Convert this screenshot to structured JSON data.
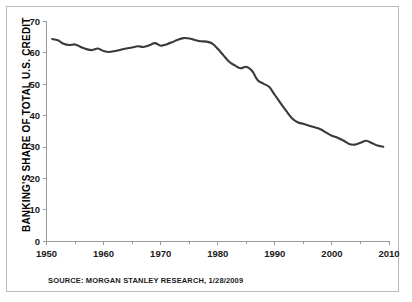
{
  "figure": {
    "source_note": "SOURCE: MORGAN STANLEY RESEARCH, 1/28/2009",
    "line_color": "#3a3a3a",
    "axis_color": "#9a9a9a",
    "border_color": "#b9b9b9",
    "background": "#ffffff"
  },
  "chart_data": {
    "type": "line",
    "title": "",
    "subtitle": "",
    "xlabel": "",
    "ylabel": "BANKING'S SHARE OF TOTAL U.S. CREDIT",
    "xlim": [
      1950,
      2010
    ],
    "ylim": [
      0,
      70
    ],
    "grid": false,
    "legend": null,
    "x_ticks": [
      1950,
      1960,
      1970,
      1980,
      1990,
      2000,
      2010
    ],
    "x_tick_labels": [
      "1950",
      "1960",
      "1970",
      "1980",
      "1990",
      "2000",
      "2010"
    ],
    "x_minor_ticks": [
      1955,
      1965,
      1975,
      1985,
      1995,
      2005
    ],
    "y_ticks": [
      0,
      10,
      20,
      30,
      40,
      50,
      60,
      70
    ],
    "y_tick_labels": [
      "0",
      "10",
      "20",
      "30",
      "40",
      "50",
      "60",
      "70"
    ],
    "units": "percent",
    "series": [
      {
        "name": "Banking's share of total U.S. credit",
        "color": "#3a3a3a",
        "x": [
          1951,
          1952,
          1953,
          1954,
          1955,
          1956,
          1957,
          1958,
          1959,
          1960,
          1961,
          1962,
          1963,
          1964,
          1965,
          1966,
          1967,
          1968,
          1969,
          1970,
          1971,
          1972,
          1973,
          1974,
          1975,
          1976,
          1977,
          1978,
          1979,
          1980,
          1981,
          1982,
          1983,
          1984,
          1985,
          1986,
          1987,
          1988,
          1989,
          1990,
          1991,
          1992,
          1993,
          1994,
          1995,
          1996,
          1997,
          1998,
          1999,
          2000,
          2001,
          2002,
          2003,
          2004,
          2005,
          2006,
          2007,
          2008,
          2009
        ],
        "values": [
          64.4,
          64.0,
          62.9,
          62.5,
          62.7,
          61.9,
          61.2,
          60.9,
          61.4,
          60.6,
          60.3,
          60.6,
          61.0,
          61.4,
          61.7,
          62.1,
          61.9,
          62.4,
          63.1,
          62.3,
          62.7,
          63.4,
          64.2,
          64.7,
          64.6,
          64.1,
          63.7,
          63.6,
          63.0,
          61.3,
          59.2,
          57.2,
          56.0,
          55.1,
          55.6,
          54.3,
          51.3,
          50.2,
          49.2,
          46.6,
          44.0,
          41.5,
          39.2,
          37.9,
          37.4,
          36.8,
          36.3,
          35.7,
          34.6,
          33.6,
          33.0,
          32.1,
          31.0,
          30.8,
          31.4,
          32.0,
          31.3,
          30.5,
          30.1
        ]
      }
    ]
  }
}
